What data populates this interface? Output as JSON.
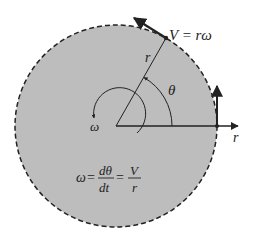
{
  "diagram": {
    "colors": {
      "disk_fill": "#bdbdbd",
      "stroke": "#222222",
      "background": "#ffffff"
    },
    "labels": {
      "velocity": "V = rω",
      "radius_on_line": "r",
      "angle": "θ",
      "omega": "ω",
      "radial_axis": "r"
    },
    "equation": {
      "lhs": "ω",
      "eq1": "=",
      "frac1_num": "dθ",
      "frac1_den": "dt",
      "eq2": "=",
      "frac2_num": "V",
      "frac2_den": "r"
    }
  }
}
